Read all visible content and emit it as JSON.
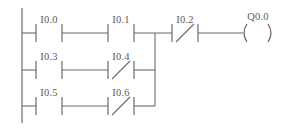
{
  "diagram": {
    "type": "plc-ladder-logic",
    "colors": {
      "line": "#6b6b6b",
      "text": "#5a5a5a",
      "background": "#ffffff"
    },
    "geometry": {
      "width": 286,
      "height": 131,
      "left_rail_x": 22,
      "rail_top_y": 8,
      "rail_bottom_y": 123,
      "junction_x": 155,
      "contact_col1_x1": 36,
      "contact_col1_x2": 62,
      "contact_col2_x1": 108,
      "contact_col2_x2": 134,
      "series_contact_x1": 172,
      "series_contact_x2": 198,
      "coil_x1": 243,
      "coil_x2": 272
    },
    "rows": [
      {
        "id": "branch-1",
        "y": 33
      },
      {
        "id": "branch-2",
        "y": 70
      },
      {
        "id": "branch-3",
        "y": 106
      }
    ],
    "contacts": [
      {
        "id": "contact-i0-0",
        "label": "I0.0",
        "kind": "normally-open",
        "row": 0,
        "column": 1,
        "x1": 36,
        "x2": 62,
        "y": 33,
        "label_x": 49,
        "label_y": 23
      },
      {
        "id": "contact-i0-1",
        "label": "I0.1",
        "kind": "normally-open",
        "row": 0,
        "column": 2,
        "x1": 108,
        "x2": 134,
        "y": 33,
        "label_x": 121,
        "label_y": 23
      },
      {
        "id": "contact-i0-3",
        "label": "I0.3",
        "kind": "normally-open",
        "row": 1,
        "column": 1,
        "x1": 36,
        "x2": 62,
        "y": 70,
        "label_x": 49,
        "label_y": 60
      },
      {
        "id": "contact-i0-4",
        "label": "I0.4",
        "kind": "normally-closed",
        "row": 1,
        "column": 2,
        "x1": 108,
        "x2": 134,
        "y": 70,
        "label_x": 121,
        "label_y": 60
      },
      {
        "id": "contact-i0-5",
        "label": "I0.5",
        "kind": "normally-open",
        "row": 2,
        "column": 1,
        "x1": 36,
        "x2": 62,
        "y": 106,
        "label_x": 49,
        "label_y": 96
      },
      {
        "id": "contact-i0-6",
        "label": "I0.6",
        "kind": "normally-closed",
        "row": 2,
        "column": 2,
        "x1": 108,
        "x2": 134,
        "y": 106,
        "label_x": 121,
        "label_y": 96
      },
      {
        "id": "contact-i0-2",
        "label": "I0.2",
        "kind": "normally-closed",
        "row": 0,
        "column": 3,
        "x1": 172,
        "x2": 198,
        "y": 33,
        "label_x": 185,
        "label_y": 23
      }
    ],
    "coil": {
      "id": "coil-q0-0",
      "label": "Q0.0",
      "kind": "output-coil",
      "x1": 243,
      "x2": 272,
      "y": 33,
      "label_x": 258,
      "label_y": 20
    },
    "labels": {
      "i0_0": "I0.0",
      "i0_1": "I0.1",
      "i0_2": "I0.2",
      "i0_3": "I0.3",
      "i0_4": "I0.4",
      "i0_5": "I0.5",
      "i0_6": "I0.6",
      "q0_0": "Q0.0"
    }
  }
}
